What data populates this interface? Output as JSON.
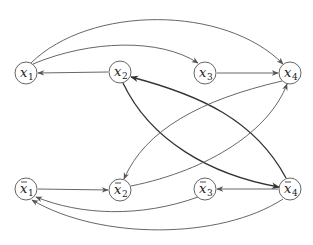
{
  "diagram": {
    "type": "directed-graph",
    "colors": {
      "node_stroke": "#555555",
      "edge": "#555555",
      "edge_thick": "#333333",
      "background": "#ffffff"
    },
    "nodes": [
      {
        "id": "x1",
        "base": "x",
        "sub": "1",
        "bar": false,
        "cx": 26,
        "cy": 73
      },
      {
        "id": "x2",
        "base": "x",
        "sub": "2",
        "bar": false,
        "cx": 120,
        "cy": 72
      },
      {
        "id": "x3",
        "base": "x",
        "sub": "3",
        "bar": false,
        "cx": 205,
        "cy": 73
      },
      {
        "id": "x4",
        "base": "x",
        "sub": "4",
        "bar": false,
        "cx": 290,
        "cy": 73
      },
      {
        "id": "nx1",
        "base": "x",
        "sub": "1",
        "bar": true,
        "cx": 26,
        "cy": 189
      },
      {
        "id": "nx2",
        "base": "x",
        "sub": "2",
        "bar": true,
        "cx": 120,
        "cy": 190
      },
      {
        "id": "nx3",
        "base": "x",
        "sub": "3",
        "bar": true,
        "cx": 205,
        "cy": 189
      },
      {
        "id": "nx4",
        "base": "x",
        "sub": "4",
        "bar": true,
        "cx": 290,
        "cy": 189
      }
    ],
    "edges": [
      {
        "from": "x1",
        "to": "x4",
        "style": "arc-up-large"
      },
      {
        "from": "x1",
        "to": "x3",
        "style": "arc-up"
      },
      {
        "from": "x2",
        "to": "x1",
        "style": "straight"
      },
      {
        "from": "x3",
        "to": "x4",
        "style": "straight"
      },
      {
        "from": "x2",
        "to": "nx4",
        "style": "thick-arc"
      },
      {
        "from": "nx4",
        "to": "x2",
        "style": "thick-arc"
      },
      {
        "from": "x4",
        "to": "nx2",
        "style": "arc"
      },
      {
        "from": "nx2",
        "to": "x4",
        "style": "arc"
      },
      {
        "from": "nx1",
        "to": "nx2",
        "style": "straight"
      },
      {
        "from": "nx4",
        "to": "nx3",
        "style": "straight"
      },
      {
        "from": "nx3",
        "to": "nx1",
        "style": "arc-down"
      },
      {
        "from": "nx4",
        "to": "nx1",
        "style": "arc-down-large"
      }
    ]
  },
  "labels": {
    "x1": {
      "base": "x",
      "sub": "1"
    },
    "x2": {
      "base": "x",
      "sub": "2"
    },
    "x3": {
      "base": "x",
      "sub": "3"
    },
    "x4": {
      "base": "x",
      "sub": "4"
    },
    "nx1": {
      "base": "x",
      "sub": "1"
    },
    "nx2": {
      "base": "x",
      "sub": "2"
    },
    "nx3": {
      "base": "x",
      "sub": "3"
    },
    "nx4": {
      "base": "x",
      "sub": "4"
    }
  }
}
